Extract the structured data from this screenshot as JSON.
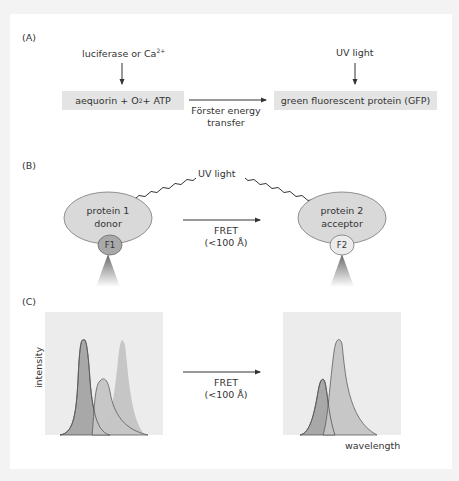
{
  "panel_a": {
    "label": "(A)",
    "top_left": "luciferase or Ca",
    "top_left_sup": "2+",
    "top_right": "UV light",
    "box_left_pre": "aequorin + O",
    "box_left_sub": "2",
    "box_left_post": " + ATP",
    "arrow_line1": "Förster energy",
    "arrow_line2": "transfer",
    "box_right": "green fluorescent protein (GFP)"
  },
  "panel_b": {
    "label": "(B)",
    "uv": "UV light",
    "p1_line1": "protein 1",
    "p1_line2": "donor",
    "f1": "F1",
    "p2_line1": "protein 2",
    "p2_line2": "acceptor",
    "f2": "F2",
    "fret": "FRET",
    "dist": "(<100 Å)"
  },
  "panel_c": {
    "label": "(C)",
    "ylabel": "intensity",
    "xlabel": "wavelength",
    "fret": "FRET",
    "dist": "(<100 Å)"
  },
  "colors": {
    "box_fill": "#e4e4e4",
    "ellipse_fill": "#d9d9d9",
    "f1_fill": "#a9a9a9",
    "f2_fill": "#ececec",
    "peak_dark": "#a8a8a8",
    "peak_light": "#c6c6c6",
    "plot_bg": "#ececec"
  }
}
